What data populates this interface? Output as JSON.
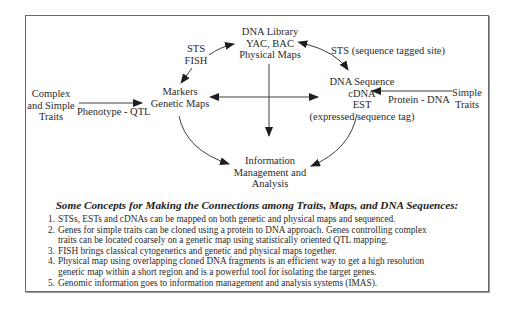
{
  "diagram": {
    "nodes": {
      "dna_library": {
        "lines": [
          "DNA Library",
          "YAC, BAC",
          "Physical Maps"
        ]
      },
      "markers": {
        "lines": [
          "Markers",
          "Genetic Maps"
        ]
      },
      "dna_sequence": {
        "lines": [
          "DNA Sequence",
          "cDNA",
          "EST",
          "(expressed sequence tag)"
        ]
      },
      "complex_traits": {
        "lines": [
          "Complex",
          "and Simple",
          "Traits"
        ]
      },
      "simple_traits": {
        "lines": [
          "Simple",
          "Traits"
        ]
      },
      "imas": {
        "lines": [
          "Information",
          "Management and",
          "Analysis"
        ]
      }
    },
    "edge_labels": {
      "sts_fish": [
        "STS",
        "FISH"
      ],
      "sts_site": "STS (sequence tagged site)",
      "phenotype_qtl": "Phenotype - QTL",
      "protein_dna": "Protein - DNA"
    },
    "edges": [
      {
        "from": "complex_traits",
        "to": "markers",
        "label": "Phenotype - QTL"
      },
      {
        "from": "simple_traits",
        "to": "dna_sequence",
        "label": "Protein - DNA"
      },
      {
        "from": "markers",
        "to": "dna_library",
        "label": "STS / FISH",
        "bidirectional": true
      },
      {
        "from": "dna_library",
        "to": "dna_sequence",
        "label": "STS (sequence tagged site)",
        "bidirectional": true
      },
      {
        "from": "markers",
        "to": "dna_sequence",
        "bidirectional": true
      },
      {
        "from": "dna_library",
        "to": "imas"
      },
      {
        "from": "markers",
        "to": "imas"
      },
      {
        "from": "dna_sequence",
        "to": "imas"
      }
    ]
  },
  "concepts": {
    "title": "Some Concepts for Making the Connections among Traits, Maps, and DNA Sequences:",
    "items": [
      {
        "num": "1.",
        "lines": [
          "STSs, ESTs and cDNAs can be mapped on both genetic and physical maps and sequenced."
        ]
      },
      {
        "num": "2.",
        "lines": [
          "Genes for simple traits can be cloned using a protein to DNA approach. Genes controlling complex",
          "traits can be located coarsely on a genetic map using statistically oriented QTL mapping."
        ]
      },
      {
        "num": "3.",
        "lines": [
          "FISH brings classical cytogenetics and genetic and physical maps together."
        ]
      },
      {
        "num": "4.",
        "lines": [
          "Physical map using overlapping cloned DNA fragments is an efficient way to get a high resolution",
          "genetic map within a short region and is a powerful tool for isolating the target genes."
        ]
      },
      {
        "num": "5.",
        "lines": [
          "Genomic information goes to information management and analysis systems (IMAS)."
        ]
      }
    ]
  },
  "colors": {
    "line": "#2a2a2a",
    "frame": "#6a6a6a",
    "background": "#ffffff"
  }
}
